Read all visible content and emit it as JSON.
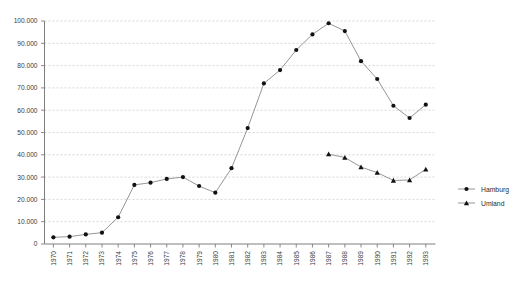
{
  "chart_data": {
    "type": "line",
    "title": "",
    "subtitle": "",
    "xlabel": "",
    "ylabel": "",
    "grid": true,
    "legend_position": "right",
    "categories": [
      "1970",
      "1971",
      "1972",
      "1973",
      "1974",
      "1975",
      "1976",
      "1977",
      "1978",
      "1979",
      "1980",
      "1981",
      "1982",
      "1983",
      "1984",
      "1985",
      "1986",
      "1987",
      "1988",
      "1989",
      "1990",
      "1991",
      "1992",
      "1993"
    ],
    "ylim": [
      0,
      100000
    ],
    "yticks": [
      0,
      10000,
      20000,
      30000,
      40000,
      50000,
      60000,
      70000,
      80000,
      90000,
      100000
    ],
    "ytick_labels": [
      "0",
      "10.000",
      "20.000",
      "30.000",
      "40.000",
      "50.000",
      "60.000",
      "70.000",
      "80.000",
      "90.000",
      "100.000"
    ],
    "series": [
      {
        "name": "Hamburg",
        "marker": "circle",
        "color": "#111111",
        "line_color": "#8a8a8a",
        "values": [
          3000,
          3300,
          4300,
          5100,
          12000,
          26500,
          27500,
          29200,
          30000,
          26000,
          23000,
          34000,
          52000,
          72000,
          78000,
          87000,
          94000,
          99000,
          95500,
          82000,
          74000,
          62000,
          56500,
          62500
        ]
      },
      {
        "name": "Umland",
        "marker": "triangle",
        "color": "#111111",
        "line_color": "#8a8a8a",
        "values": [
          null,
          null,
          null,
          null,
          null,
          null,
          null,
          null,
          null,
          null,
          null,
          null,
          null,
          null,
          null,
          null,
          null,
          40300,
          38800,
          34500,
          32000,
          28500,
          28700,
          33500
        ]
      }
    ]
  },
  "legend": {
    "items": [
      {
        "label": "Hamburg",
        "marker": "circle"
      },
      {
        "label": "Umland",
        "marker": "triangle"
      }
    ]
  }
}
